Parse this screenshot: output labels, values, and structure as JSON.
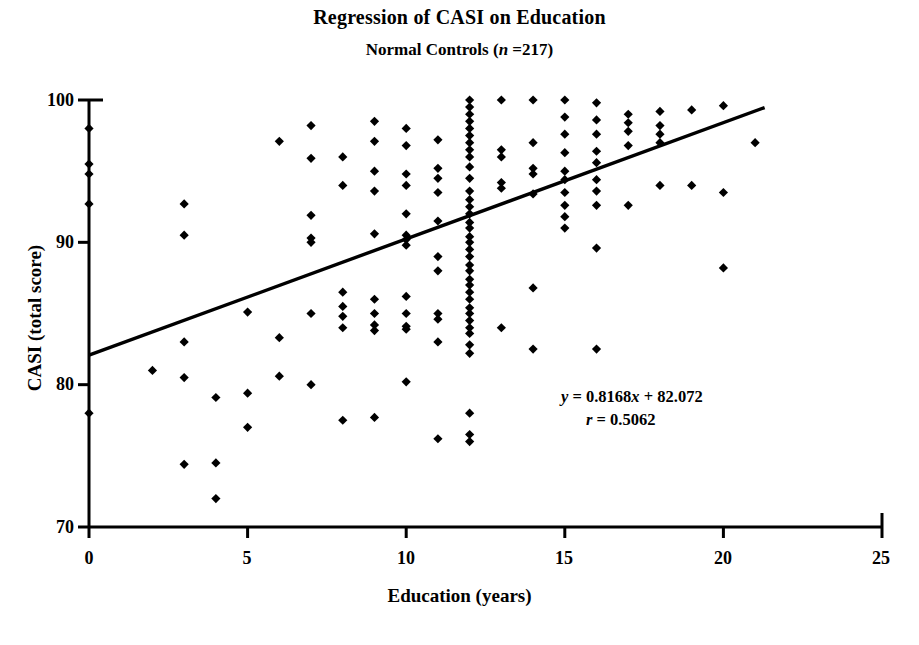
{
  "chart_data": {
    "type": "scatter",
    "title": "Regression of CASI on Education",
    "subtitle_prefix": "Normal Controls (",
    "subtitle_italic": "n",
    "subtitle_suffix": " =217)",
    "xlabel": "Education (years)",
    "ylabel": "CASI (total score)",
    "xlim": [
      0,
      25
    ],
    "ylim": [
      70,
      100
    ],
    "xticks": [
      "0",
      "5",
      "10",
      "15",
      "20",
      "25"
    ],
    "xtick_values": [
      0,
      5,
      10,
      15,
      20,
      25
    ],
    "yticks": [
      "70",
      "80",
      "90",
      "100"
    ],
    "ytick_values": [
      70,
      80,
      90,
      100
    ],
    "grid": false,
    "legend": "none",
    "n": 217,
    "marker": "diamond",
    "marker_color": "#000000",
    "line_color": "#000000",
    "annotations": {
      "equation_y": "y",
      "equation_eq1": " = 0.8168",
      "equation_x": "x",
      "equation_rest": "  + 82.072",
      "equation_full": "y = 0.8168x  + 82.072",
      "correlation_r": "r",
      "correlation_value": "  = 0.5062",
      "correlation_full": "r = 0.5062"
    },
    "fit": {
      "slope": 0.8168,
      "intercept": 82.072,
      "r": 0.5062,
      "x_start": 0,
      "x_end": 21.3
    },
    "points": [
      [
        0,
        98.0
      ],
      [
        0,
        95.5
      ],
      [
        0,
        94.8
      ],
      [
        0,
        92.7
      ],
      [
        0,
        78.0
      ],
      [
        2,
        81.0
      ],
      [
        3,
        92.7
      ],
      [
        3,
        90.5
      ],
      [
        3,
        83.0
      ],
      [
        3,
        80.5
      ],
      [
        3,
        74.4
      ],
      [
        4,
        79.1
      ],
      [
        4,
        74.5
      ],
      [
        4,
        72.0
      ],
      [
        5,
        85.1
      ],
      [
        5,
        79.4
      ],
      [
        5,
        77.0
      ],
      [
        6,
        97.1
      ],
      [
        6,
        83.3
      ],
      [
        6,
        80.6
      ],
      [
        7,
        98.2
      ],
      [
        7,
        95.9
      ],
      [
        7,
        91.9
      ],
      [
        7,
        90.3
      ],
      [
        7,
        90.0
      ],
      [
        7,
        85.0
      ],
      [
        7,
        80.0
      ],
      [
        8,
        96.0
      ],
      [
        8,
        94.0
      ],
      [
        8,
        86.5
      ],
      [
        8,
        85.5
      ],
      [
        8,
        84.8
      ],
      [
        8,
        84.0
      ],
      [
        8,
        77.5
      ],
      [
        9,
        98.5
      ],
      [
        9,
        97.1
      ],
      [
        9,
        95.0
      ],
      [
        9,
        93.6
      ],
      [
        9,
        90.6
      ],
      [
        9,
        86.0
      ],
      [
        9,
        85.0
      ],
      [
        9,
        84.2
      ],
      [
        9,
        83.8
      ],
      [
        9,
        77.7
      ],
      [
        10,
        98.0
      ],
      [
        10,
        96.8
      ],
      [
        10,
        94.8
      ],
      [
        10,
        94.0
      ],
      [
        10,
        92.0
      ],
      [
        10,
        90.5
      ],
      [
        10,
        90.2
      ],
      [
        10,
        89.8
      ],
      [
        10,
        86.2
      ],
      [
        10,
        85.0
      ],
      [
        10,
        84.1
      ],
      [
        10,
        83.9
      ],
      [
        10,
        80.2
      ],
      [
        11,
        97.2
      ],
      [
        11,
        95.2
      ],
      [
        11,
        94.5
      ],
      [
        11,
        93.5
      ],
      [
        11,
        91.5
      ],
      [
        11,
        89.0
      ],
      [
        11,
        88.0
      ],
      [
        11,
        85.0
      ],
      [
        11,
        84.6
      ],
      [
        11,
        83.0
      ],
      [
        11,
        76.2
      ],
      [
        12,
        100.0
      ],
      [
        12,
        99.5
      ],
      [
        12,
        99.0
      ],
      [
        12,
        98.5
      ],
      [
        12,
        98.0
      ],
      [
        12,
        97.5
      ],
      [
        12,
        97.0
      ],
      [
        12,
        96.5
      ],
      [
        12,
        96.0
      ],
      [
        12,
        95.3
      ],
      [
        12,
        94.5
      ],
      [
        12,
        93.6
      ],
      [
        12,
        93.0
      ],
      [
        12,
        92.5
      ],
      [
        12,
        92.0
      ],
      [
        12,
        91.4
      ],
      [
        12,
        91.0
      ],
      [
        12,
        90.4
      ],
      [
        12,
        90.0
      ],
      [
        12,
        89.5
      ],
      [
        12,
        89.0
      ],
      [
        12,
        88.4
      ],
      [
        12,
        88.0
      ],
      [
        12,
        87.4
      ],
      [
        12,
        87.0
      ],
      [
        12,
        86.5
      ],
      [
        12,
        86.0
      ],
      [
        12,
        85.4
      ],
      [
        12,
        85.0
      ],
      [
        12,
        84.5
      ],
      [
        12,
        84.0
      ],
      [
        12,
        83.6
      ],
      [
        12,
        82.8
      ],
      [
        12,
        82.2
      ],
      [
        12,
        78.0
      ],
      [
        12,
        76.5
      ],
      [
        12,
        76.0
      ],
      [
        13,
        100.0
      ],
      [
        13,
        96.5
      ],
      [
        13,
        96.0
      ],
      [
        13,
        94.2
      ],
      [
        13,
        93.8
      ],
      [
        13,
        84.0
      ],
      [
        14,
        100.0
      ],
      [
        14,
        97.0
      ],
      [
        14,
        95.2
      ],
      [
        14,
        94.8
      ],
      [
        14,
        93.4
      ],
      [
        14,
        86.8
      ],
      [
        14,
        82.5
      ],
      [
        15,
        100.0
      ],
      [
        15,
        98.8
      ],
      [
        15,
        97.6
      ],
      [
        15,
        96.3
      ],
      [
        15,
        95.0
      ],
      [
        15,
        94.4
      ],
      [
        15,
        93.5
      ],
      [
        15,
        92.6
      ],
      [
        15,
        91.8
      ],
      [
        15,
        91.0
      ],
      [
        16,
        99.8
      ],
      [
        16,
        98.6
      ],
      [
        16,
        97.6
      ],
      [
        16,
        96.4
      ],
      [
        16,
        95.6
      ],
      [
        16,
        94.4
      ],
      [
        16,
        93.6
      ],
      [
        16,
        92.6
      ],
      [
        16,
        89.6
      ],
      [
        16,
        82.5
      ],
      [
        17,
        99.0
      ],
      [
        17,
        98.4
      ],
      [
        17,
        97.8
      ],
      [
        17,
        96.8
      ],
      [
        17,
        92.6
      ],
      [
        18,
        99.2
      ],
      [
        18,
        98.2
      ],
      [
        18,
        97.6
      ],
      [
        18,
        97.0
      ],
      [
        18,
        94.0
      ],
      [
        19,
        99.3
      ],
      [
        19,
        94.0
      ],
      [
        20,
        99.6
      ],
      [
        20,
        93.5
      ],
      [
        20,
        88.2
      ],
      [
        21,
        97.0
      ]
    ]
  }
}
